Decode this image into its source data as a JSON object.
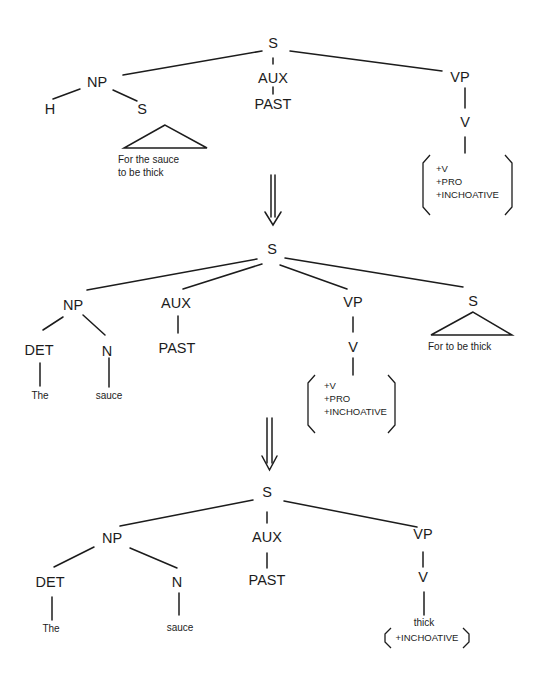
{
  "figure": {
    "tree1": {
      "root": "S",
      "np": "NP",
      "np_head": "H",
      "np_s": "S",
      "np_s_text": [
        "For the sauce",
        "to be thick"
      ],
      "aux": "AUX",
      "aux_value": "PAST",
      "vp": "VP",
      "v": "V",
      "v_features": [
        "+V",
        "+PRO",
        "+INCHOATIVE"
      ]
    },
    "tree2": {
      "root": "S",
      "np": "NP",
      "det": "DET",
      "det_word": "The",
      "n": "N",
      "n_word": "sauce",
      "aux": "AUX",
      "aux_value": "PAST",
      "vp": "VP",
      "v": "V",
      "v_features": [
        "+V",
        "+PRO",
        "+INCHOATIVE"
      ],
      "s": "S",
      "s_text": "For to be thick"
    },
    "tree3": {
      "root": "S",
      "np": "NP",
      "det": "DET",
      "det_word": "The",
      "n": "N",
      "n_word": "sauce",
      "aux": "AUX",
      "aux_value": "PAST",
      "vp": "VP",
      "v": "V",
      "v_word": "thick",
      "v_features": [
        "+INCHOATIVE"
      ]
    },
    "arrows": [
      {
        "icon": "double-down-arrow"
      },
      {
        "icon": "double-down-arrow"
      }
    ]
  }
}
